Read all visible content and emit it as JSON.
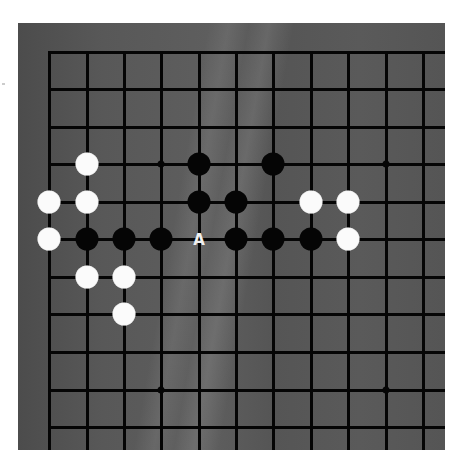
{
  "board": {
    "background": "#595959",
    "line_color": "#050505",
    "columns_x": [
      49,
      87,
      124,
      161,
      199,
      236,
      273,
      311,
      348,
      386,
      423
    ],
    "rows_y": [
      52,
      89,
      127,
      164,
      202,
      239,
      277,
      314,
      352,
      390,
      427
    ],
    "star_points": [
      {
        "col": 3,
        "row": 3
      },
      {
        "col": 9,
        "row": 3
      },
      {
        "col": 3,
        "row": 9
      },
      {
        "col": 9,
        "row": 9
      }
    ],
    "stones": [
      {
        "color": "white",
        "col": 1,
        "row": 3
      },
      {
        "color": "black",
        "col": 4,
        "row": 3
      },
      {
        "color": "black",
        "col": 6,
        "row": 3
      },
      {
        "color": "white",
        "col": 0,
        "row": 4
      },
      {
        "color": "white",
        "col": 1,
        "row": 4
      },
      {
        "color": "black",
        "col": 4,
        "row": 4
      },
      {
        "color": "black",
        "col": 5,
        "row": 4
      },
      {
        "color": "white",
        "col": 7,
        "row": 4
      },
      {
        "color": "white",
        "col": 8,
        "row": 4
      },
      {
        "color": "white",
        "col": 0,
        "row": 5
      },
      {
        "color": "black",
        "col": 1,
        "row": 5
      },
      {
        "color": "black",
        "col": 2,
        "row": 5
      },
      {
        "color": "black",
        "col": 3,
        "row": 5
      },
      {
        "color": "black",
        "col": 5,
        "row": 5
      },
      {
        "color": "black",
        "col": 6,
        "row": 5
      },
      {
        "color": "black",
        "col": 7,
        "row": 5
      },
      {
        "color": "white",
        "col": 8,
        "row": 5
      },
      {
        "color": "white",
        "col": 1,
        "row": 6
      },
      {
        "color": "white",
        "col": 2,
        "row": 6
      },
      {
        "color": "white",
        "col": 2,
        "row": 7
      }
    ],
    "labels": [
      {
        "text": "A",
        "col": 4,
        "row": 5
      }
    ]
  }
}
